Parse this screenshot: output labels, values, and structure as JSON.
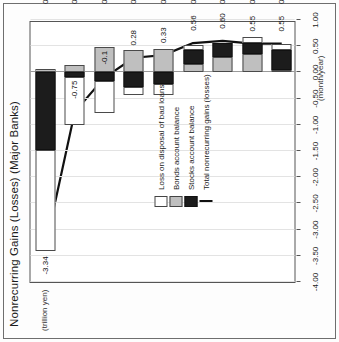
{
  "chart_data": {
    "type": "bar",
    "title": "Nonrecurring Gains (Losses) (Major Banks)",
    "ylabel": "(trillion yen)",
    "xlabel": "(month/year)",
    "grid": true,
    "legend_position": "inside-right",
    "orientation": "rotated-90-ccw",
    "categories": [
      "03/9",
      "03/10",
      "03/11",
      "03/12",
      "03/13",
      "03/14",
      "03/15",
      "03/16",
      "03/17"
    ],
    "ylim": [
      -4.0,
      1.0
    ],
    "yticks": [
      "1.00",
      "0.50",
      "0.00",
      "-0.50",
      "-1.00",
      "-1.50",
      "-2.00",
      "-2.50",
      "-3.00",
      "-3.50",
      "-4.00"
    ],
    "ytick_values": [
      1.0,
      0.5,
      0.0,
      -0.5,
      -1.0,
      -1.5,
      -2.0,
      -2.5,
      -3.0,
      -3.5,
      -4.0
    ],
    "series": [
      {
        "name": "Loss on disposal of bad loans",
        "key": "loss",
        "color": "#ffffff",
        "values": [
          -1.93,
          -0.92,
          -0.6,
          -0.16,
          -0.2,
          0.11,
          0.0,
          0.11,
          0.12
        ]
      },
      {
        "name": "Bonds account balance",
        "key": "bonds",
        "color": "#bfbfbf",
        "values": [
          0.07,
          0.14,
          0.48,
          0.42,
          0.45,
          0.16,
          0.3,
          0.36,
          0.05
        ]
      },
      {
        "name": "Stocks account balance",
        "key": "stocks",
        "color": "#1c1c1c",
        "values": [
          -1.48,
          -0.08,
          -0.17,
          -0.27,
          -0.23,
          0.26,
          0.27,
          0.2,
          0.38
        ]
      },
      {
        "name": "Total nonrecurring gains (losses)",
        "key": "total",
        "color": "#111111",
        "type": "line",
        "values": [
          -3.34,
          -0.75,
          -0.1,
          0.28,
          0.33,
          0.56,
          0.6,
          0.55,
          0.55
        ]
      }
    ],
    "point_labels": [
      {
        "category": "03/9",
        "text": "-3.34"
      },
      {
        "category": "03/10",
        "text": "-0.75"
      },
      {
        "category": "03/11",
        "text": "-0.1"
      },
      {
        "category": "03/12",
        "text": "0.28"
      },
      {
        "category": "03/13",
        "text": "0.33"
      },
      {
        "category": "03/14",
        "text": "0.56"
      },
      {
        "category": "03/15",
        "text": "0.60"
      },
      {
        "category": "03/16",
        "text": "0.55"
      },
      {
        "category": "03/17",
        "text": "0.55"
      }
    ]
  }
}
